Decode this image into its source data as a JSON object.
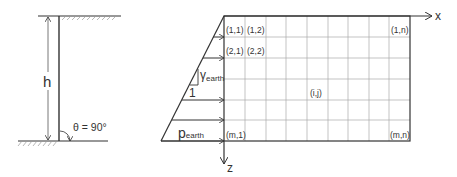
{
  "left_figure": {
    "height_label": "h",
    "angle_label": "θ = 90°"
  },
  "right_figure": {
    "x_axis_label": "x",
    "z_axis_label": "z",
    "slope_label": "γ",
    "slope_subscript": "earth",
    "slope_run_label": "1",
    "pressure_label": "p",
    "pressure_subscript": "earth",
    "grid": {
      "rows": 6,
      "cols": 9
    },
    "cell_labels": {
      "c11": "(1,1)",
      "c12": "(1,2)",
      "c21": "(2,1)",
      "c22": "(2,2)",
      "c1n": "(1,n)",
      "cij": "(i,j)",
      "cm1": "(m,1)",
      "cmn": "(m,n)"
    }
  },
  "colors": {
    "line": "#333333",
    "grid": "#999999",
    "hatch": "#888888"
  }
}
